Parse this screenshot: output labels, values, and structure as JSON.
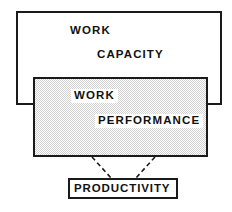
{
  "diagram": {
    "colors": {
      "stroke": "#1a1a1a",
      "fill_white": "#ffffff",
      "fill_gray": "#ececec",
      "text": "#111111"
    },
    "boxes": [
      {
        "id": "work-capacity",
        "label_line1": "WORK",
        "label_line2": "CAPACITY",
        "fill": "white",
        "border": "solid"
      },
      {
        "id": "work-performance",
        "label_line1": "WORK",
        "label_line2": "PERFORMANCE",
        "fill": "gray-halftone",
        "border": "solid"
      },
      {
        "id": "productivity",
        "label_line1": "PRODUCTIVITY",
        "fill": "white",
        "border": "solid"
      }
    ],
    "connectors": [
      {
        "id": "left-connector",
        "style": "dashed",
        "from": "work-performance",
        "to": "productivity"
      },
      {
        "id": "right-connector",
        "style": "dashed",
        "from": "work-performance",
        "to": "productivity"
      }
    ]
  }
}
